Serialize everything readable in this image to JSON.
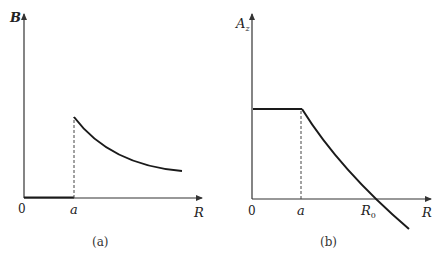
{
  "panel_a": {
    "caption": "(a)",
    "ylabel": "B",
    "xlabel": "R",
    "origin": "0",
    "tick_a": "a",
    "description": "B is zero for R < a, jumps at R = a, then decays as R increases"
  },
  "panel_b": {
    "caption": "(b)",
    "ylabel": "A",
    "ylabel_sub": "z",
    "xlabel": "R",
    "origin": "0",
    "tick_a": "a",
    "tick_r0": "R",
    "tick_r0_sub": "0",
    "description": "A_z is constant for R < a, then decreases, crossing zero at R0 and continuing negative"
  },
  "colors": {
    "curve": "#1a1a1a",
    "axis": "#333333",
    "dashed": "#444444"
  }
}
